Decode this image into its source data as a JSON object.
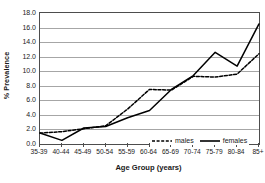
{
  "chart_data": {
    "type": "line",
    "title": "",
    "xlabel": "Age Group (years)",
    "ylabel": "% Prevalence",
    "categories": [
      "35-39",
      "40-44",
      "45-49",
      "50-54",
      "55-59",
      "60-64",
      "65-69",
      "70-74",
      "75-79",
      "80-84",
      "85+"
    ],
    "series": [
      {
        "name": "males",
        "style": "dashed",
        "color": "#000000",
        "values": [
          1.5,
          1.7,
          2.1,
          2.5,
          4.8,
          7.5,
          7.4,
          9.3,
          9.2,
          9.6,
          12.4
        ]
      },
      {
        "name": "females",
        "style": "solid",
        "color": "#000000",
        "values": [
          1.5,
          0.5,
          2.2,
          2.4,
          3.6,
          4.6,
          7.5,
          9.4,
          12.6,
          10.7,
          16.5
        ]
      }
    ],
    "ylim": [
      0.0,
      18.0
    ],
    "ytick_step": 2.0,
    "ytick_labels": [
      "18.0",
      "16.0",
      "14.0",
      "12.0",
      "10.0",
      "8.0",
      "6.0",
      "4.0",
      "2.0",
      "0.0"
    ],
    "grid": true,
    "grid_axis": "y",
    "legend_position": "inside-bottom-right"
  },
  "legend": {
    "items": [
      {
        "label": "males",
        "style": "dashed"
      },
      {
        "label": "females",
        "style": "solid"
      }
    ]
  },
  "axes": {
    "x_title": "Age Group (years)",
    "y_title": "% Prevalence"
  }
}
